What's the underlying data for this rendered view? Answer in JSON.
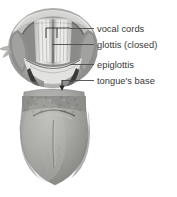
{
  "figure": {
    "background_color": "#ffffff",
    "line_color": "#4a4a4a",
    "text_color": "#373737"
  },
  "callouts": [
    {
      "id": "vocal-cords",
      "label": "vocal cords",
      "leader_from_x": 94,
      "leader_to_x": 70,
      "leader_y": 28
    },
    {
      "id": "glottis",
      "label": "glottis (closed)",
      "leader_from_x": 94,
      "leader_to_x": 52,
      "leader_y": 44
    },
    {
      "id": "epiglottis",
      "label": "epiglottis",
      "leader_from_x": 94,
      "leader_to_x": 70,
      "leader_y": 64
    },
    {
      "id": "tongues-base",
      "label": "tongue's base",
      "leader_from_x": 94,
      "leader_to_x": 62,
      "leader_y": 80
    }
  ],
  "pointer_ticks": {
    "vocal_cord_left_x": 46,
    "vocal_cord_right_x": 57,
    "tick_top_y": 28,
    "tick_bottom_y": 38,
    "tongue_base_tick_x": 62,
    "tongue_base_tick_bottom_y": 88
  },
  "palette": {
    "tissue_light": "#d8d8d6",
    "tissue_mid": "#a9a9a7",
    "tissue_dark": "#6e6e6c",
    "shadow": "#4b4b4a",
    "highlight": "#ececeb",
    "tongue_body": "#9d9d99",
    "tongue_edge": "#bdbdba",
    "cleft_dark": "#2f2f2e"
  }
}
